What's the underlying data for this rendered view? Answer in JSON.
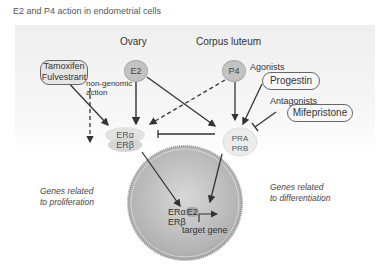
{
  "title": "E2 and P4 action in endometrial cells",
  "headers": {
    "ovary": "Ovary",
    "corpus_luteum": "Corpus luteum"
  },
  "hormones": {
    "e2": "E2",
    "p4": "P4"
  },
  "drugs": {
    "tamoxifen": "Tamoxifen",
    "fulvestrant": "Fulvestrant",
    "agonists_label": "Agonists",
    "progestin": "Progestin",
    "antagonists_label": "Antagonists",
    "mifepristone": "Mifepristone"
  },
  "non_genomic": {
    "line1": "non-genomic",
    "line2": "action"
  },
  "receptors": {
    "er_alpha": "ERα",
    "er_beta": "ERβ",
    "pr_a": "PRA",
    "pr_b": "PRB"
  },
  "nucleus": {
    "er_alpha": "ERα",
    "e2": "E2",
    "er_beta": "ERβ",
    "target_gene": "target gene"
  },
  "outcomes": {
    "proliferation_line1": "Genes related",
    "proliferation_line2": "to proliferation",
    "differentiation_line1": "Genes related",
    "differentiation_line2": "to differentiation"
  },
  "colors": {
    "hormone_fill": "#c3c3c3",
    "nucleus_fill": "#bdbdbd",
    "arrow": "#333333",
    "panel": "#efefef"
  }
}
